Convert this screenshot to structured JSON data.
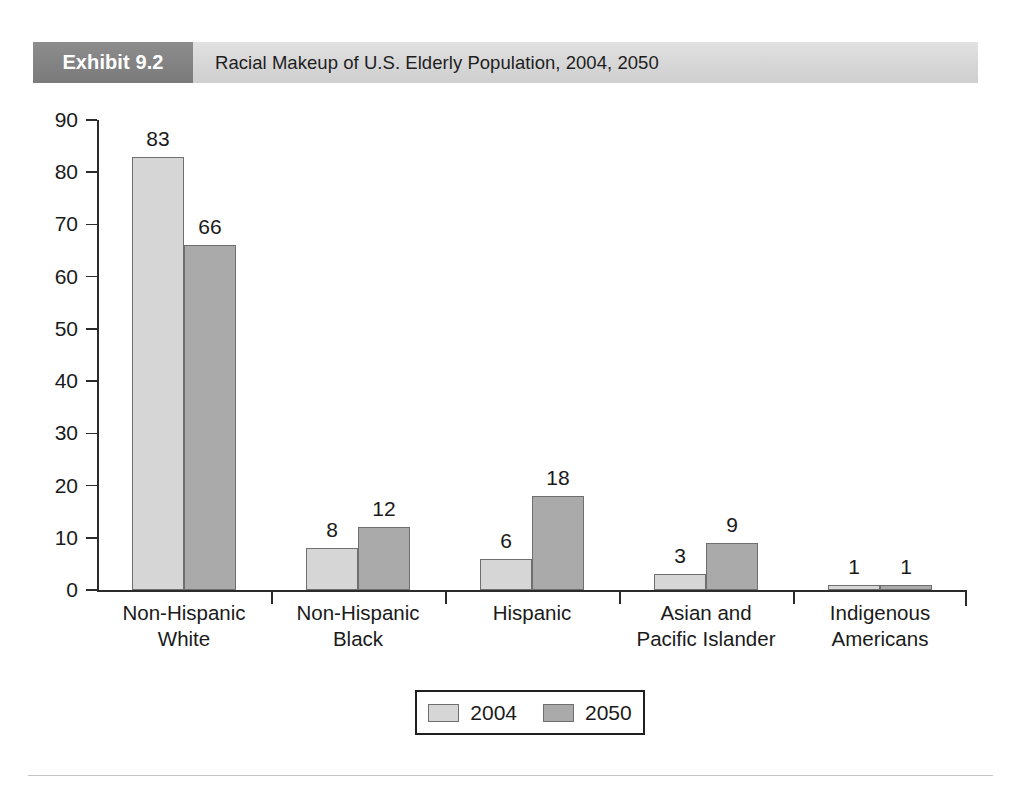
{
  "header": {
    "exhibit_number": "Exhibit 9.2",
    "title": "Racial Makeup of U.S. Elderly Population, 2004, 2050",
    "number_box_color": "#848484",
    "bar_color": "#d8d8d8"
  },
  "legend": {
    "entries": [
      {
        "label": "2004",
        "color": "#d6d6d6"
      },
      {
        "label": "2050",
        "color": "#aaaaaa"
      }
    ]
  },
  "chart_data": {
    "type": "bar",
    "title": "Racial Makeup of U.S. Elderly Population, 2004, 2050",
    "xlabel": "",
    "ylabel": "",
    "ylim": [
      0,
      90
    ],
    "yticks": [
      0,
      10,
      20,
      30,
      40,
      50,
      60,
      70,
      80,
      90
    ],
    "ytick_labels": [
      "0",
      "10",
      "20",
      "30",
      "40",
      "50",
      "60",
      "70",
      "80",
      "90"
    ],
    "grid": false,
    "legend_position": "bottom-center",
    "categories": [
      "Non-Hispanic\nWhite",
      "Non-Hispanic\nBlack",
      "Hispanic",
      "Asian and\nPacific Islander",
      "Indigenous\nAmericans"
    ],
    "category_lines": [
      [
        "Non-Hispanic",
        "White"
      ],
      [
        "Non-Hispanic",
        "Black"
      ],
      [
        "Hispanic",
        ""
      ],
      [
        "Asian and",
        "Pacific Islander"
      ],
      [
        "Indigenous",
        "Americans"
      ]
    ],
    "series": [
      {
        "name": "2004",
        "color": "#d6d6d6",
        "values": [
          83,
          8,
          6,
          3,
          1
        ]
      },
      {
        "name": "2050",
        "color": "#aaaaaa",
        "values": [
          66,
          12,
          18,
          9,
          1
        ]
      }
    ],
    "data_labels": [
      [
        "83",
        "66"
      ],
      [
        "8",
        "12"
      ],
      [
        "6",
        "18"
      ],
      [
        "3",
        "9"
      ],
      [
        "1",
        "1"
      ]
    ]
  }
}
